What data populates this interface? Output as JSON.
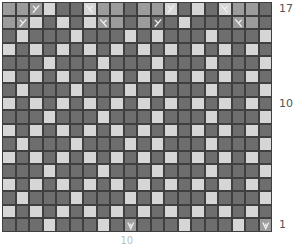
{
  "chart": {
    "columns": 20,
    "rows": 17,
    "colors": {
      "D": "#6e6e6e",
      "M": "#9c9c9c",
      "L": "#d6d6d6",
      "grid": "#3f3f3f",
      "symbol": "#f0f0f0"
    },
    "legend_codes": {
      "D": "dark",
      "M": "mid",
      "L": "light",
      "xl": "left-slant-decrease",
      "xr": "right-slant-decrease",
      "v": "v-stitch"
    },
    "grid_rows_top_to_bottom": [
      {
        "row": 17,
        "cells": [
          "M",
          "M",
          "M:xl",
          "L",
          "D",
          "D",
          "L:xr",
          "M",
          "M",
          "D",
          "M",
          "M",
          "L:xl",
          "D",
          "L",
          "D",
          "L:xr",
          "M",
          "M",
          "D"
        ]
      },
      {
        "row": 16,
        "cells": [
          "M",
          "M:xl",
          "L",
          "D",
          "L",
          "D",
          "L",
          "M:xr",
          "M",
          "D",
          "M",
          "D:xl",
          "D",
          "L",
          "D",
          "D",
          "D",
          "M:xr",
          "M",
          "D"
        ]
      },
      {
        "row": 15,
        "cells": [
          "D",
          "L",
          "D",
          "D",
          "D",
          "L",
          "D",
          "D",
          "D",
          "L",
          "D",
          "L",
          "D",
          "D",
          "D",
          "L",
          "D",
          "D",
          "D",
          "L"
        ]
      },
      {
        "row": 14,
        "cells": [
          "L",
          "D",
          "L",
          "D",
          "L",
          "D",
          "L",
          "D",
          "L",
          "D",
          "L",
          "D",
          "L",
          "D",
          "L",
          "D",
          "L",
          "D",
          "L",
          "D"
        ]
      },
      {
        "row": 13,
        "cells": [
          "D",
          "D",
          "D",
          "L",
          "D",
          "D",
          "D",
          "L",
          "D",
          "D",
          "D",
          "L",
          "D",
          "D",
          "D",
          "L",
          "D",
          "D",
          "D",
          "L"
        ]
      },
      {
        "row": 12,
        "cells": [
          "L",
          "D",
          "L",
          "D",
          "L",
          "D",
          "L",
          "D",
          "L",
          "D",
          "L",
          "D",
          "L",
          "D",
          "L",
          "D",
          "L",
          "D",
          "L",
          "D"
        ]
      },
      {
        "row": 11,
        "cells": [
          "D",
          "L",
          "D",
          "D",
          "D",
          "L",
          "D",
          "D",
          "D",
          "L",
          "D",
          "L",
          "D",
          "D",
          "D",
          "L",
          "D",
          "D",
          "D",
          "L"
        ]
      },
      {
        "row": 10,
        "cells": [
          "L",
          "D",
          "L",
          "D",
          "L",
          "D",
          "L",
          "D",
          "L",
          "D",
          "L",
          "D",
          "L",
          "D",
          "L",
          "D",
          "L",
          "D",
          "L",
          "D"
        ]
      },
      {
        "row": 9,
        "cells": [
          "D",
          "D",
          "D",
          "L",
          "D",
          "D",
          "D",
          "L",
          "D",
          "D",
          "D",
          "L",
          "D",
          "D",
          "D",
          "L",
          "D",
          "D",
          "D",
          "L"
        ]
      },
      {
        "row": 8,
        "cells": [
          "L",
          "D",
          "L",
          "D",
          "L",
          "D",
          "L",
          "D",
          "L",
          "D",
          "L",
          "D",
          "L",
          "D",
          "L",
          "D",
          "L",
          "D",
          "L",
          "D"
        ]
      },
      {
        "row": 7,
        "cells": [
          "D",
          "L",
          "D",
          "D",
          "D",
          "L",
          "D",
          "D",
          "D",
          "L",
          "D",
          "L",
          "D",
          "D",
          "D",
          "L",
          "D",
          "D",
          "D",
          "L"
        ]
      },
      {
        "row": 6,
        "cells": [
          "L",
          "D",
          "L",
          "D",
          "L",
          "D",
          "L",
          "D",
          "L",
          "D",
          "L",
          "D",
          "L",
          "D",
          "L",
          "D",
          "L",
          "D",
          "L",
          "D"
        ]
      },
      {
        "row": 5,
        "cells": [
          "D",
          "D",
          "D",
          "L",
          "D",
          "D",
          "D",
          "L",
          "D",
          "D",
          "D",
          "L",
          "D",
          "D",
          "D",
          "L",
          "D",
          "D",
          "D",
          "L"
        ]
      },
      {
        "row": 4,
        "cells": [
          "L",
          "D",
          "L",
          "D",
          "L",
          "D",
          "L",
          "D",
          "L",
          "D",
          "L",
          "D",
          "L",
          "D",
          "L",
          "D",
          "L",
          "D",
          "L",
          "D"
        ]
      },
      {
        "row": 3,
        "cells": [
          "D",
          "L",
          "D",
          "D",
          "D",
          "L",
          "D",
          "D",
          "D",
          "L",
          "D",
          "L",
          "D",
          "D",
          "D",
          "L",
          "D",
          "D",
          "D",
          "L"
        ]
      },
      {
        "row": 2,
        "cells": [
          "L",
          "D",
          "L",
          "D",
          "L",
          "D",
          "L",
          "D",
          "L",
          "D",
          "L",
          "D",
          "L",
          "D",
          "L",
          "D",
          "L",
          "D",
          "L",
          "D"
        ]
      },
      {
        "row": 1,
        "cells": [
          "D",
          "D",
          "D",
          "L",
          "D",
          "D",
          "D",
          "L",
          "D",
          "M:v",
          "D",
          "D",
          "D",
          "L",
          "D",
          "D",
          "D",
          "L",
          "D",
          "M:v"
        ]
      }
    ],
    "row_labels": [
      {
        "text": "17",
        "row": 17
      },
      {
        "text": "10",
        "row": 10
      },
      {
        "text": "1",
        "row": 1
      }
    ],
    "col_labels": [
      {
        "text": "10",
        "col": 10
      }
    ]
  }
}
